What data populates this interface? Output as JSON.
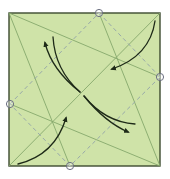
{
  "diagram": {
    "type": "origami-crease-pattern",
    "paper_color": "#cfe3a8",
    "border_color": "#3c4a30",
    "crease_color": "#86a86c",
    "valley_fold_color": "#97a8a8",
    "arrow_color": "#1e2a18",
    "marker_color": "#6b6f80",
    "square": {
      "x": 9,
      "y": 13,
      "w": 151,
      "h": 153
    },
    "reference_points": [
      {
        "name": "top",
        "x": 99,
        "y": 13
      },
      {
        "name": "right",
        "x": 160,
        "y": 77
      },
      {
        "name": "left",
        "x": 10,
        "y": 104
      },
      {
        "name": "bottom",
        "x": 70,
        "y": 166
      }
    ]
  }
}
